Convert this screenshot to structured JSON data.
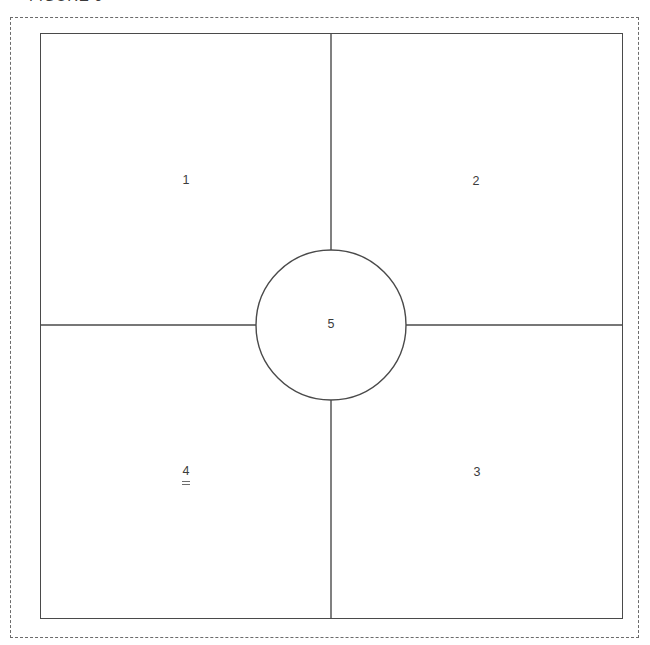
{
  "figure": {
    "caption": "FIGURE 6",
    "title_clipped": true
  },
  "diagram": {
    "type": "floor-plan-quadrant-schematic",
    "outer_boundary": {
      "name": "site-boundary",
      "style": "dashed",
      "color": "#6b6b6b"
    },
    "plan_square": {
      "name": "building-outline",
      "style": "solid",
      "color": "#4a4a4a"
    },
    "center_circle": {
      "name": "central-rotunda",
      "color": "#4a4a4a"
    },
    "dividers": {
      "vertical_label": "vertical-partition",
      "horizontal_label": "horizontal-partition",
      "color": "#4a4a4a"
    },
    "regions": [
      {
        "id": "1",
        "label": "1",
        "position": "upper-left"
      },
      {
        "id": "2",
        "label": "2",
        "position": "upper-right"
      },
      {
        "id": "3",
        "label": "3",
        "position": "lower-right"
      },
      {
        "id": "4",
        "label": "4",
        "position": "lower-left"
      },
      {
        "id": "5",
        "label": "5",
        "position": "center"
      }
    ]
  }
}
